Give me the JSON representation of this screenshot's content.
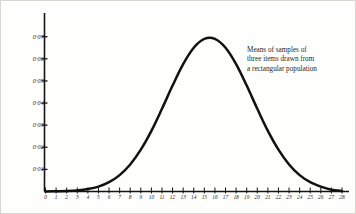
{
  "figure": {
    "title": "",
    "background_color": "#fefefc",
    "ink_color": "#111111",
    "border_color": "#d8d6d0"
  },
  "annotation": {
    "line1": "Means of samples of",
    "line2": "three items drawn from",
    "line3": "a rectangular population"
  },
  "chart_data": {
    "type": "line",
    "title": "",
    "subtitle": "",
    "xlabel": "",
    "ylabel": "",
    "grid": false,
    "legend": null,
    "annotations": [
      "Means of samples of three items drawn from a rectangular population"
    ],
    "xlim": [
      0,
      28
    ],
    "ylim": [
      0,
      0.078
    ],
    "xticks": [
      0,
      1,
      2,
      3,
      4,
      5,
      6,
      7,
      8,
      9,
      10,
      11,
      12,
      13,
      14,
      15,
      16,
      17,
      18,
      19,
      20,
      21,
      22,
      23,
      24,
      25,
      26,
      27,
      28
    ],
    "xticklabels": [
      "0",
      "1",
      "2",
      "3",
      "4",
      "5",
      "6",
      "7",
      "8",
      "9",
      "10",
      "11",
      "12",
      "13",
      "14",
      "15",
      "16",
      "17",
      "18",
      "19",
      "20",
      "21",
      "22",
      "23",
      "24",
      "25",
      "26",
      "27",
      "28"
    ],
    "yticks": [
      0.01,
      0.02,
      0.03,
      0.04,
      0.05,
      0.06,
      0.07
    ],
    "yticklabels": [
      "0·01",
      "0·02",
      "0·03",
      "0·04",
      "0·05",
      "0·06",
      "0·07"
    ],
    "series": [
      {
        "name": "Distribution of means of samples of three",
        "x": [
          0,
          1,
          2,
          3,
          4,
          5,
          6,
          7,
          8,
          9,
          10,
          11,
          12,
          13,
          14,
          15,
          16,
          17,
          18,
          19,
          20,
          21,
          22,
          23,
          24,
          25,
          26,
          27,
          28
        ],
        "y": [
          0.0,
          0.0001,
          0.0002,
          0.0005,
          0.0011,
          0.0022,
          0.0042,
          0.0074,
          0.0122,
          0.0189,
          0.0274,
          0.0374,
          0.0479,
          0.0576,
          0.065,
          0.069,
          0.069,
          0.065,
          0.0576,
          0.0479,
          0.0374,
          0.0274,
          0.0189,
          0.0122,
          0.0074,
          0.0042,
          0.0022,
          0.0008,
          0.0002
        ]
      }
    ],
    "peak": {
      "x": 14.6,
      "y": 0.0693
    }
  }
}
